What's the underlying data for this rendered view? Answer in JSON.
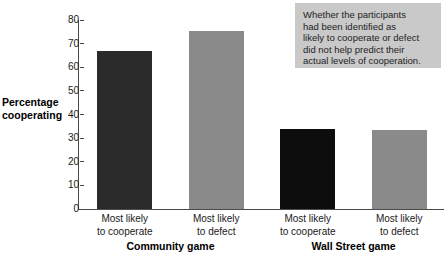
{
  "chart_data": {
    "type": "bar",
    "title": "",
    "xlabel": "",
    "ylabel": "Percentage cooperating",
    "ylim": [
      0,
      80
    ],
    "yticks": [
      "0",
      "10",
      "20",
      "30",
      "40",
      "50",
      "60",
      "70",
      "80"
    ],
    "grid": false,
    "legend": "none",
    "categories": [
      "Most likely\nto cooperate",
      "Most likely\nto defect",
      "Most likely\nto cooperate",
      "Most likely\nto defect"
    ],
    "groups": [
      "Community game",
      "Wall Street game"
    ],
    "values": [
      67,
      75.5,
      34,
      33.5
    ],
    "bar_colors": [
      "#2b2b2b",
      "#8a8a8a",
      "#0d0d0d",
      "#8a8a8a"
    ],
    "annotation": "Whether the participants had been identified as likely to cooperate or defect did not help predict their actual levels of cooperation."
  },
  "axis": {
    "y_title": "Percentage\ncooperating"
  },
  "annotation": {
    "text": "Whether the participants\nhad been identified as\nlikely to cooperate or defect\ndid not help predict their\nactual levels of cooperation.",
    "background": "#c9c9c9"
  },
  "colors": {
    "axis": "#4a4a4a",
    "text": "#1a1a1a",
    "background": "#ffffff"
  }
}
